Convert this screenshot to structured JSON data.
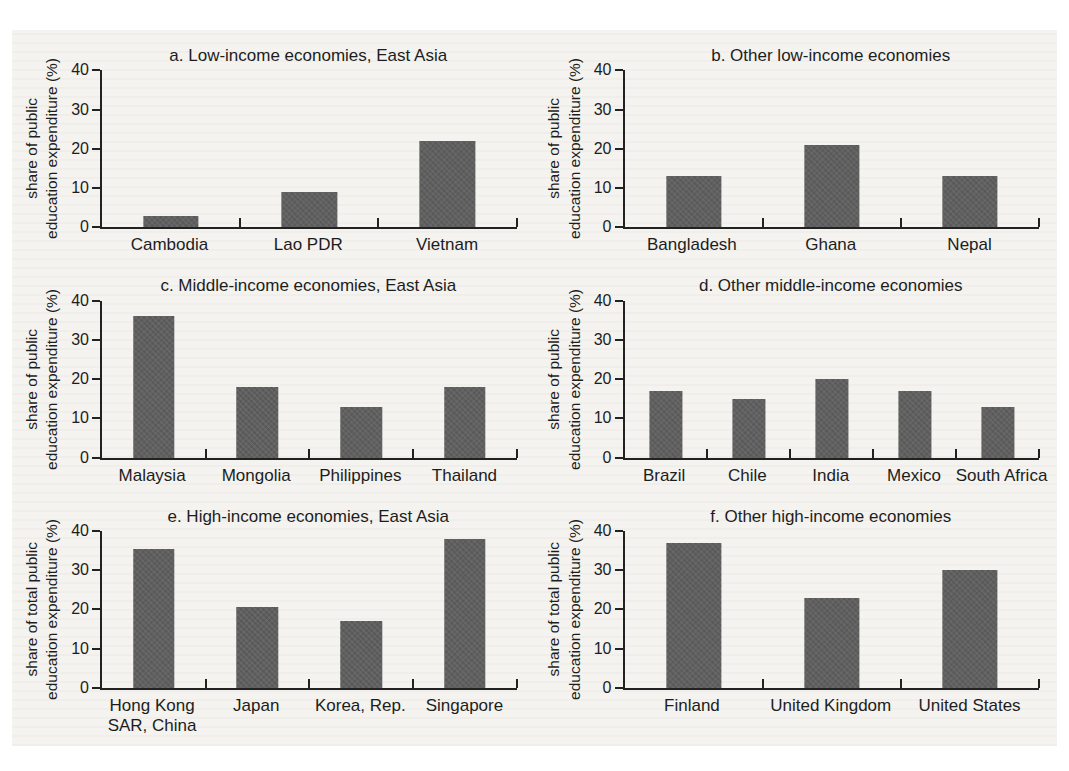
{
  "figure": {
    "background_color": "#f4f3ef",
    "page_color": "#ffffff",
    "bar_color": "#5f5f5f",
    "axis_color": "#222222",
    "text_color": "#1d1d1d"
  },
  "chart_data": [
    {
      "id": "a",
      "type": "bar",
      "title": "a. Low-income economies, East Asia",
      "ylabel": "share of public education expenditure (%)",
      "ylabel_lines": [
        "share of public",
        "education expenditure (%)"
      ],
      "xlabel": "",
      "ylim": [
        0,
        40
      ],
      "yticks": [
        40,
        30,
        20,
        10,
        0
      ],
      "grid": false,
      "legend": "none",
      "categories": [
        "Cambodia",
        "Lao PDR",
        "Vietnam"
      ],
      "values": [
        3,
        9,
        22
      ]
    },
    {
      "id": "b",
      "type": "bar",
      "title": "b. Other low-income economies",
      "ylabel": "share of public education expenditure (%)",
      "ylabel_lines": [
        "share of public",
        "education expenditure (%)"
      ],
      "xlabel": "",
      "ylim": [
        0,
        40
      ],
      "yticks": [
        40,
        30,
        20,
        10,
        0
      ],
      "grid": false,
      "legend": "none",
      "categories": [
        "Bangladesh",
        "Ghana",
        "Nepal"
      ],
      "values": [
        13,
        21,
        13
      ]
    },
    {
      "id": "c",
      "type": "bar",
      "title": "c. Middle-income economies, East Asia",
      "ylabel": "share of public education expenditure (%)",
      "ylabel_lines": [
        "share of public",
        "education expenditure (%)"
      ],
      "xlabel": "",
      "ylim": [
        0,
        40
      ],
      "yticks": [
        40,
        30,
        20,
        10,
        0
      ],
      "grid": false,
      "legend": "none",
      "categories": [
        "Malaysia",
        "Mongolia",
        "Philippines",
        "Thailand"
      ],
      "values": [
        36,
        18,
        13,
        18
      ]
    },
    {
      "id": "d",
      "type": "bar",
      "title": "d. Other middle-income economies",
      "ylabel": "share of public education expenditure (%)",
      "ylabel_lines": [
        "share of public",
        "education expenditure (%)"
      ],
      "xlabel": "",
      "ylim": [
        0,
        40
      ],
      "yticks": [
        40,
        30,
        20,
        10,
        0
      ],
      "grid": false,
      "legend": "none",
      "categories": [
        "Brazil",
        "Chile",
        "India",
        "Mexico",
        "South Africa"
      ],
      "values": [
        17,
        15,
        20,
        17,
        13
      ]
    },
    {
      "id": "e",
      "type": "bar",
      "title": "e. High-income economies, East Asia",
      "ylabel": "share of total public education expenditure (%)",
      "ylabel_lines": [
        "share of total public",
        "education expenditure (%)"
      ],
      "xlabel": "",
      "ylim": [
        0,
        40
      ],
      "yticks": [
        40,
        30,
        20,
        10,
        0
      ],
      "grid": false,
      "legend": "none",
      "categories": [
        "Hong Kong SAR, China",
        "Japan",
        "Korea, Rep.",
        "Singapore"
      ],
      "values": [
        35.5,
        20.5,
        17,
        38
      ]
    },
    {
      "id": "f",
      "type": "bar",
      "title": "f. Other high-income economies",
      "ylabel": "share of total public education expenditure (%)",
      "ylabel_lines": [
        "share of total public",
        "education expenditure (%)"
      ],
      "xlabel": "",
      "ylim": [
        0,
        40
      ],
      "yticks": [
        40,
        30,
        20,
        10,
        0
      ],
      "grid": false,
      "legend": "none",
      "categories": [
        "Finland",
        "United Kingdom",
        "United States"
      ],
      "values": [
        37,
        23,
        30
      ]
    }
  ]
}
